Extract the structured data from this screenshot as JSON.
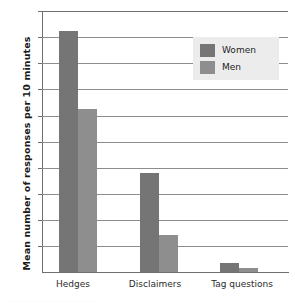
{
  "chart_data": {
    "type": "bar",
    "title": "",
    "xlabel": "",
    "ylabel": "Mean number of responses per 10 minutes",
    "categories": [
      "Hedges",
      "Disclaimers",
      "Tag questions"
    ],
    "series": [
      {
        "name": "Women",
        "values": [
          18.5,
          7.6,
          0.7
        ],
        "color": "#757575"
      },
      {
        "name": "Men",
        "values": [
          12.5,
          2.8,
          0.3
        ],
        "color": "#8e8e8e"
      }
    ],
    "ylim": [
      0,
      20
    ],
    "ytick_labels": [
      "2",
      "4",
      "6",
      "8",
      "10",
      "12",
      "14",
      "16",
      "18",
      "20"
    ],
    "ytick_values": [
      2,
      4,
      6,
      8,
      10,
      12,
      14,
      16,
      18,
      20
    ],
    "grid": true,
    "legend_position": "upper right",
    "legend_entries": [
      "Women",
      "Men"
    ]
  },
  "legend": {
    "women_label": "Women",
    "men_label": "Men"
  },
  "axis": {
    "y_title": "Mean number of responses per 10 minutes",
    "y_ticks": {
      "t20": "20",
      "t18": "18",
      "t16": "16",
      "t14": "14",
      "t12": "12",
      "t10": "10",
      "t8": "8",
      "t6": "6",
      "t4": "4",
      "t2": "2"
    },
    "x_ticks": {
      "c0": "Hedges",
      "c1": "Disclaimers",
      "c2": "Tag questions"
    }
  }
}
